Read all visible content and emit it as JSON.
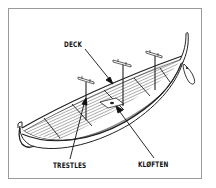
{
  "diagram": {
    "labels": {
      "deck": "DECK",
      "trestles": "TRESTLES",
      "kloften": "KLØFTEN"
    },
    "colors": {
      "ink": "#111111",
      "frame": "#9a9a9a",
      "background": "#ffffff"
    }
  }
}
